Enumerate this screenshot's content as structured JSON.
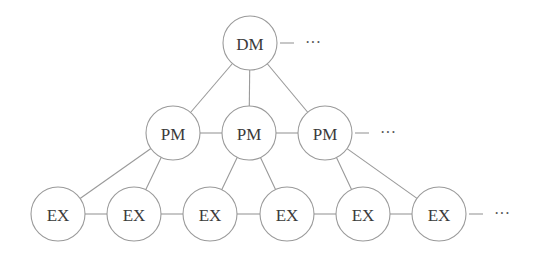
{
  "diagram": {
    "type": "hierarchy",
    "colors": {
      "stroke": "#9a9a9a",
      "text": "#3a3a3a",
      "background": "#ffffff"
    },
    "node_radius": 27,
    "nodes": [
      {
        "id": "dm",
        "label": "DM",
        "x": 250,
        "y": 43
      },
      {
        "id": "pm1",
        "label": "PM",
        "x": 173,
        "y": 133
      },
      {
        "id": "pm2",
        "label": "PM",
        "x": 249,
        "y": 133
      },
      {
        "id": "pm3",
        "label": "PM",
        "x": 325,
        "y": 133
      },
      {
        "id": "ex1",
        "label": "EX",
        "x": 58,
        "y": 214
      },
      {
        "id": "ex2",
        "label": "EX",
        "x": 134,
        "y": 214
      },
      {
        "id": "ex3",
        "label": "EX",
        "x": 210,
        "y": 214
      },
      {
        "id": "ex4",
        "label": "EX",
        "x": 287,
        "y": 214
      },
      {
        "id": "ex5",
        "label": "EX",
        "x": 363,
        "y": 214
      },
      {
        "id": "ex6",
        "label": "EX",
        "x": 439,
        "y": 214
      }
    ],
    "edges": [
      [
        "dm",
        "pm1"
      ],
      [
        "dm",
        "pm2"
      ],
      [
        "dm",
        "pm3"
      ],
      [
        "pm1",
        "pm2"
      ],
      [
        "pm2",
        "pm3"
      ],
      [
        "pm1",
        "ex1"
      ],
      [
        "pm1",
        "ex2"
      ],
      [
        "pm2",
        "ex3"
      ],
      [
        "pm2",
        "ex4"
      ],
      [
        "pm3",
        "ex5"
      ],
      [
        "pm3",
        "ex6"
      ],
      [
        "ex1",
        "ex2"
      ],
      [
        "ex2",
        "ex3"
      ],
      [
        "ex3",
        "ex4"
      ],
      [
        "ex4",
        "ex5"
      ],
      [
        "ex5",
        "ex6"
      ]
    ],
    "continuations": [
      {
        "from": "dm",
        "label": "···"
      },
      {
        "from": "pm3",
        "label": "···"
      },
      {
        "from": "ex6",
        "label": "···"
      }
    ]
  }
}
